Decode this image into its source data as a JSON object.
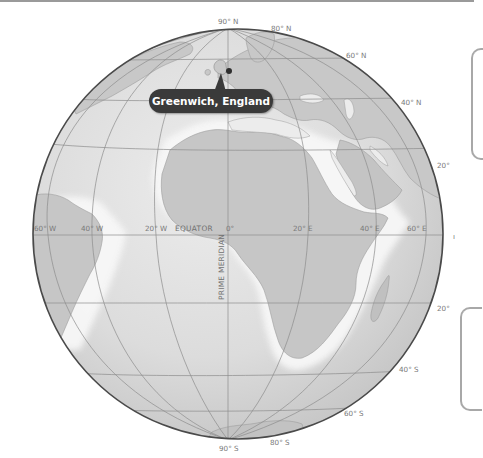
{
  "map": {
    "type": "orthographic globe",
    "callout": {
      "label": "Greenwich, England",
      "background": "#3a3a3a",
      "text_color": "#ffffff"
    },
    "reference_lines": {
      "equator": "EQUATOR",
      "prime_meridian": "PRIME MERIDIAN"
    },
    "latitude_labels": {
      "n90": "90° N",
      "n80": "80° N",
      "n60": "60° N",
      "n40": "40° N",
      "n20": "20°",
      "s20": "20°",
      "s40": "40° S",
      "s60": "60° S",
      "s80": "80° S",
      "s90": "90° S"
    },
    "longitude_labels": {
      "w60": "60° W",
      "w40": "40° W",
      "w20": "20° W",
      "zero": "0°",
      "e20": "20° E",
      "e40": "40° E",
      "e60": "60° E"
    },
    "colors": {
      "ocean": "#d9d9d9",
      "land": "#c4c4c4",
      "coast_glow": "#f4f4f4",
      "grid": "#8c8c8c",
      "globe_edge": "#4a4a4a",
      "marker": "#2e2e2e"
    }
  },
  "side_panels": [
    {
      "position": "upper-right",
      "content": ""
    },
    {
      "position": "lower-right",
      "content": ""
    }
  ]
}
